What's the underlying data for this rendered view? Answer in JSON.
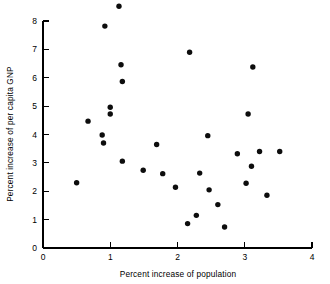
{
  "chart_data": {
    "type": "scatter",
    "title": "",
    "xlabel": "Percent increase of population",
    "ylabel": "Percent increase of per capita GNP",
    "xlim": [
      0,
      4
    ],
    "ylim": [
      0,
      8
    ],
    "xticks": [
      0,
      1,
      2,
      3,
      4
    ],
    "yticks": [
      0,
      1,
      2,
      3,
      4,
      5,
      6,
      7,
      8
    ],
    "xticklabels": [
      "0",
      "1",
      "2",
      "3",
      "4"
    ],
    "yticklabels": [
      "0",
      "1",
      "2",
      "3",
      "4",
      "5",
      "6",
      "7",
      "8"
    ],
    "grid": false,
    "legend": null,
    "marker": "filled-circle",
    "marker_color": "#0d0d0d",
    "n_points": 31,
    "points": [
      {
        "x": 0.5,
        "y": 2.3
      },
      {
        "x": 0.67,
        "y": 4.47
      },
      {
        "x": 0.88,
        "y": 3.98
      },
      {
        "x": 0.9,
        "y": 3.7
      },
      {
        "x": 0.92,
        "y": 7.82
      },
      {
        "x": 1.0,
        "y": 4.96
      },
      {
        "x": 1.0,
        "y": 4.72
      },
      {
        "x": 1.13,
        "y": 8.52
      },
      {
        "x": 1.16,
        "y": 6.46
      },
      {
        "x": 1.18,
        "y": 5.87
      },
      {
        "x": 1.18,
        "y": 3.06
      },
      {
        "x": 1.49,
        "y": 2.74
      },
      {
        "x": 1.69,
        "y": 3.65
      },
      {
        "x": 1.78,
        "y": 2.62
      },
      {
        "x": 1.97,
        "y": 2.14
      },
      {
        "x": 2.15,
        "y": 0.86
      },
      {
        "x": 2.18,
        "y": 6.9
      },
      {
        "x": 2.28,
        "y": 1.15
      },
      {
        "x": 2.33,
        "y": 2.64
      },
      {
        "x": 2.45,
        "y": 3.96
      },
      {
        "x": 2.47,
        "y": 2.05
      },
      {
        "x": 2.6,
        "y": 1.53
      },
      {
        "x": 2.7,
        "y": 0.74
      },
      {
        "x": 2.89,
        "y": 3.32
      },
      {
        "x": 3.02,
        "y": 2.28
      },
      {
        "x": 3.05,
        "y": 4.72
      },
      {
        "x": 3.1,
        "y": 2.88
      },
      {
        "x": 3.12,
        "y": 6.38
      },
      {
        "x": 3.22,
        "y": 3.4
      },
      {
        "x": 3.33,
        "y": 1.86
      },
      {
        "x": 3.52,
        "y": 3.4
      }
    ]
  },
  "axes": {
    "x_axis_label": "Percent increase of population",
    "y_axis_label": "Percent increase of per capita GNP"
  }
}
